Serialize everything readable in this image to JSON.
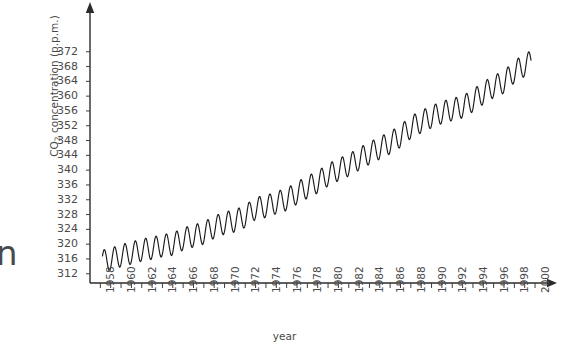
{
  "figure": {
    "xlabel": "year",
    "ylabel_prefix": "CO",
    "ylabel_sub": "2",
    "ylabel_suffix": " concentration (p.p.m.)",
    "edge_artifact_glyph": "n",
    "axis_color": "#2b2b2b",
    "line_color": "#1a1a1a",
    "background_color": "#ffffff",
    "text_color": "#4a4a4a"
  },
  "chart_data": {
    "type": "line",
    "title": "",
    "subtitle": "",
    "xlabel": "year",
    "ylabel": "CO2 concentration (p.p.m.)",
    "xlim": [
      1957.0,
      2001.0
    ],
    "ylim": [
      310,
      374
    ],
    "grid": false,
    "legend": "none",
    "annotations": [],
    "y_ticks": [
      312,
      316,
      320,
      324,
      328,
      332,
      336,
      340,
      344,
      348,
      352,
      356,
      360,
      364,
      368,
      372
    ],
    "y_tick_labels": [
      "312",
      "316",
      "320",
      "324",
      "328",
      "332",
      "336",
      "340",
      "344",
      "348",
      "352",
      "356",
      "360",
      "364",
      "368",
      "372"
    ],
    "y_tick_step": 4,
    "x_ticks": [
      1958,
      1959,
      1960,
      1961,
      1962,
      1963,
      1964,
      1965,
      1966,
      1967,
      1968,
      1969,
      1970,
      1971,
      1972,
      1973,
      1974,
      1975,
      1976,
      1977,
      1978,
      1979,
      1980,
      1981,
      1982,
      1983,
      1984,
      1985,
      1986,
      1987,
      1988,
      1989,
      1990,
      1991,
      1992,
      1993,
      1994,
      1995,
      1996,
      1997,
      1998,
      1999,
      2000
    ],
    "x_tick_labels": [
      "1958",
      "1960",
      "1962",
      "1964",
      "1966",
      "1968",
      "1970",
      "1972",
      "1974",
      "1976",
      "1978",
      "1980",
      "1982",
      "1984",
      "1986",
      "1988",
      "1990",
      "1992",
      "1994",
      "1996",
      "1998",
      "2000"
    ],
    "x_tick_label_years": [
      1958,
      1960,
      1962,
      1964,
      1966,
      1968,
      1970,
      1972,
      1974,
      1976,
      1978,
      1980,
      1982,
      1984,
      1986,
      1988,
      1990,
      1992,
      1994,
      1996,
      1998,
      2000
    ],
    "x_tick_label_rotation": -90,
    "x_minor_tick_interval": 1,
    "series": [
      {
        "name": "Mauna Loa atmospheric CO2 (monthly mean)",
        "description": "Keeling curve: rising trend with annual seasonal sawtooth oscillation of about 6 p.p.m.",
        "annual_amplitude_ppm": 6.0,
        "seasonal_peak_month": 5,
        "seasonal_trough_month": 10,
        "x": [
          1958,
          1959,
          1960,
          1961,
          1962,
          1963,
          1964,
          1965,
          1966,
          1967,
          1968,
          1969,
          1970,
          1971,
          1972,
          1973,
          1974,
          1975,
          1976,
          1977,
          1978,
          1979,
          1980,
          1981,
          1982,
          1983,
          1984,
          1985,
          1986,
          1987,
          1988,
          1989,
          1990,
          1991,
          1992,
          1993,
          1994,
          1995,
          1996,
          1997,
          1998,
          1999
        ],
        "annual_mean": [
          315.3,
          315.9,
          316.9,
          317.6,
          318.4,
          318.9,
          319.6,
          320.0,
          321.4,
          322.2,
          323.0,
          324.6,
          325.7,
          326.3,
          327.5,
          329.7,
          330.2,
          331.2,
          332.1,
          333.8,
          335.4,
          336.8,
          338.7,
          340.1,
          341.4,
          343.0,
          344.6,
          346.0,
          347.4,
          349.2,
          351.6,
          353.1,
          354.4,
          355.6,
          356.4,
          357.1,
          358.8,
          360.8,
          362.6,
          363.8,
          366.6,
          368.3
        ]
      }
    ]
  },
  "layout": {
    "plot_left_px": 90,
    "plot_bottom_px": 283,
    "plot_right_px": 545,
    "plot_top_px": 10,
    "x_pixels_per_year": 10.35,
    "y_pixels_per_ppm": 3.7,
    "y_value_at_baseline": 309.5,
    "x_year_at_axis_origin": 1957.0
  }
}
